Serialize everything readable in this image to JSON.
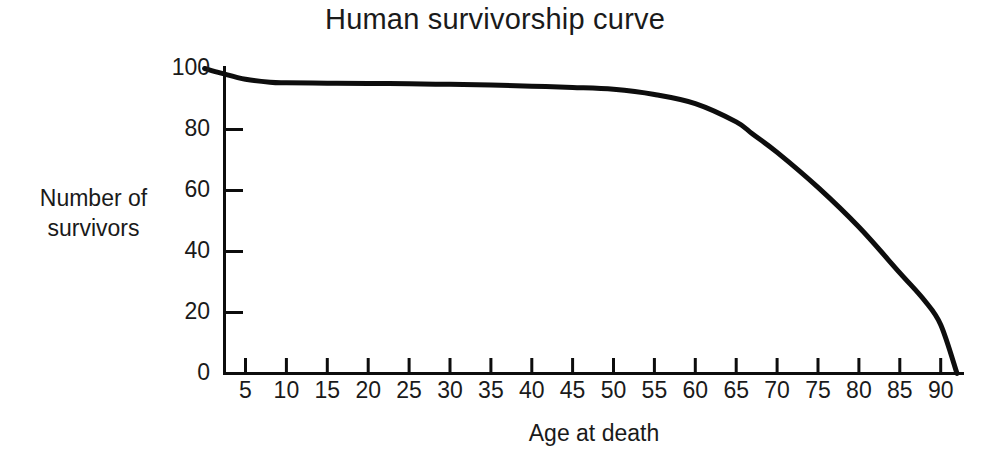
{
  "chart_data": {
    "type": "line",
    "title": "Human survivorship curve",
    "xlabel": "Age at death",
    "ylabel": "Number of survivors",
    "ylabel_lines": [
      "Number of",
      "survivors"
    ],
    "xlim": [
      0,
      95
    ],
    "ylim": [
      0,
      100
    ],
    "grid": false,
    "legend": null,
    "line_color": "#0d0d0d",
    "line_width": 5,
    "axis_color": "#0d0d0d",
    "background": "#ffffff",
    "xticks": [
      5,
      10,
      15,
      20,
      25,
      30,
      35,
      40,
      45,
      50,
      55,
      60,
      65,
      70,
      75,
      80,
      85,
      90
    ],
    "xtick_labels": [
      "5",
      "10",
      "15",
      "20",
      "25",
      "30",
      "35",
      "40",
      "45",
      "50",
      "55",
      "60",
      "65",
      "70",
      "75",
      "80",
      "85",
      "90"
    ],
    "yticks": [
      0,
      20,
      40,
      60,
      80,
      100
    ],
    "ytick_labels": [
      "0",
      "20",
      "40",
      "60",
      "80",
      "100"
    ],
    "series": [
      {
        "name": "Survivors",
        "x": [
          0,
          2,
          5,
          8,
          10,
          15,
          20,
          25,
          30,
          35,
          40,
          45,
          50,
          55,
          60,
          65,
          67,
          70,
          75,
          80,
          85,
          88,
          90,
          92
        ],
        "y": [
          100,
          98.5,
          96.5,
          95.5,
          95.3,
          95.2,
          95.1,
          95.0,
          94.8,
          94.6,
          94.2,
          93.8,
          93.2,
          91.5,
          88.5,
          82.5,
          78.5,
          72.5,
          61.0,
          48.0,
          33.0,
          24.0,
          16.0,
          0
        ]
      }
    ]
  }
}
